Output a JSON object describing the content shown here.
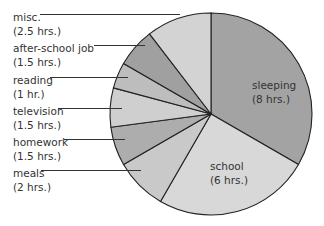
{
  "chart_data": {
    "type": "pie",
    "title": "",
    "total_hours": 24,
    "start_angle_deg": 0,
    "direction": "clockwise",
    "slices": [
      {
        "label": "sleeping",
        "value": 8,
        "value_text": "(8 hrs.)",
        "color": "#a3a3a3",
        "label_position": "inside"
      },
      {
        "label": "school",
        "value": 6,
        "value_text": "(6 hrs.)",
        "color": "#d8d8d8",
        "label_position": "inside"
      },
      {
        "label": "meals",
        "value": 2,
        "value_text": "(2 hrs.)",
        "color": "#c9c9c9",
        "label_position": "outside"
      },
      {
        "label": "homework",
        "value": 1.5,
        "value_text": "(1.5 hrs.)",
        "color": "#adadad",
        "label_position": "outside"
      },
      {
        "label": "television",
        "value": 1.5,
        "value_text": "(1.5 hrs.)",
        "color": "#cfcfcf",
        "label_position": "outside"
      },
      {
        "label": "reading",
        "value": 1,
        "value_text": "(1 hr.)",
        "color": "#bdbdbd",
        "label_position": "outside"
      },
      {
        "label": "after-school job",
        "value": 1.5,
        "value_text": "(1.5 hrs.)",
        "color": "#a0a0a0",
        "label_position": "outside"
      },
      {
        "label": "misc.",
        "value": 2.5,
        "value_text": "(2.5 hrs.)",
        "color": "#d3d3d3",
        "label_position": "outside"
      }
    ],
    "legend": "none"
  }
}
